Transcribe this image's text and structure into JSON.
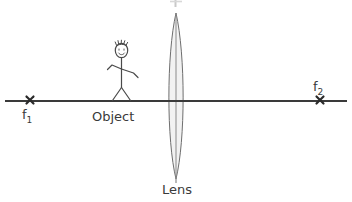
{
  "diagram": {
    "background_color": "#ffffff",
    "line_color": "#3a3a3a",
    "lens_fill_color": "#f2f2f2",
    "lens_stroke_color": "#6e6e6e",
    "labels": {
      "object": "Object",
      "lens": "Lens",
      "focal_left": "f",
      "focal_left_sub": "1",
      "focal_right": "f",
      "focal_right_sub": "2"
    },
    "markers": {
      "focal_left_glyph": "x",
      "focal_right_glyph": "x"
    },
    "geometry": {
      "axis_y": 101,
      "axis_x_start": 5,
      "axis_x_end": 347,
      "focal_left_x": 30,
      "focal_right_x": 320,
      "lens_center_x": 176,
      "lens_top_y": 13,
      "lens_bottom_y": 179,
      "lens_half_width": 9.5,
      "object_x": 122
    }
  }
}
